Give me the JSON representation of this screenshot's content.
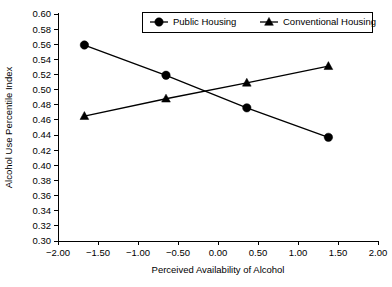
{
  "chart_data": {
    "type": "line",
    "title": "",
    "xlabel": "Perceived Availability of Alcohol",
    "ylabel": "Alcohol Use Percentile Index",
    "xlim": [
      -2.0,
      2.0
    ],
    "ylim": [
      0.3,
      0.6
    ],
    "xticks": [
      "-2.00",
      "-1.50",
      "-1.00",
      "-0.50",
      "0.00",
      "0.50",
      "1.00",
      "1.50",
      "2.00"
    ],
    "xtick_values": [
      -2.0,
      -1.5,
      -1.0,
      -0.5,
      0.0,
      0.5,
      1.0,
      1.5,
      2.0
    ],
    "yticks": [
      "0.60",
      "0.58",
      "0.56",
      "0.54",
      "0.52",
      "0.50",
      "0.48",
      "0.46",
      "0.44",
      "0.42",
      "0.40",
      "0.38",
      "0.36",
      "0.34",
      "0.32",
      "0.30"
    ],
    "ytick_values": [
      0.6,
      0.58,
      0.56,
      0.54,
      0.52,
      0.5,
      0.48,
      0.46,
      0.44,
      0.42,
      0.4,
      0.38,
      0.36,
      0.34,
      0.32,
      0.3
    ],
    "grid": false,
    "legend_position": "top-center",
    "series": [
      {
        "name": "Public Housing",
        "marker": "circle",
        "color": "#000000",
        "x": [
          -1.67,
          -0.65,
          0.36,
          1.38
        ],
        "values": [
          0.559,
          0.519,
          0.476,
          0.437
        ]
      },
      {
        "name": "Conventional Housing",
        "marker": "triangle",
        "color": "#000000",
        "x": [
          -1.67,
          -0.65,
          0.36,
          1.38
        ],
        "values": [
          0.465,
          0.488,
          0.509,
          0.531
        ]
      }
    ]
  }
}
